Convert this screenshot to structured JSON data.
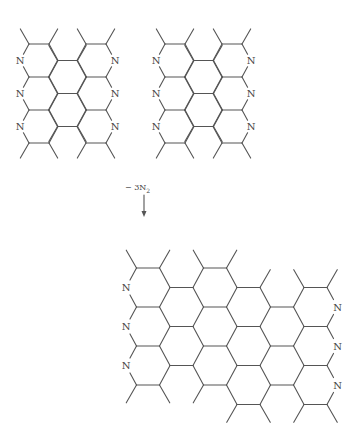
{
  "diagram": {
    "type": "chemical-reaction-scheme",
    "atom_label": "N",
    "line_color": "#555555",
    "text_color": "#444444",
    "reaction": {
      "minus_sign": "−",
      "coefficient": "3",
      "species": "N",
      "subscript": "2",
      "arrow": "down-arrow"
    },
    "reactants": [
      {
        "name": "reactant-left",
        "origin": [
          39,
          60.5
        ],
        "hex": {
          "rx": 19,
          "tx": 10,
          "ry": 16.5
        },
        "columns": [
          {
            "dx": 0,
            "dy": 0,
            "count": 3,
            "n_side": "left"
          },
          {
            "dx": 28.5,
            "dy": 16.5,
            "count": 2,
            "n_side": ""
          },
          {
            "dx": 57,
            "dy": 0,
            "count": 3,
            "n_side": "right"
          }
        ]
      },
      {
        "name": "reactant-right",
        "origin": [
          175,
          60.5
        ],
        "hex": {
          "rx": 19,
          "tx": 10,
          "ry": 16.5
        },
        "columns": [
          {
            "dx": 0,
            "dy": 0,
            "count": 3,
            "n_side": "left"
          },
          {
            "dx": 28.5,
            "dy": 16.5,
            "count": 2,
            "n_side": ""
          },
          {
            "dx": 57,
            "dy": 0,
            "count": 3,
            "n_side": "right"
          }
        ]
      }
    ],
    "product": {
      "name": "product",
      "origin": [
        148,
        287.5
      ],
      "hex": {
        "rx": 22,
        "tx": 11.5,
        "ry": 19.5
      },
      "columns": [
        {
          "dx": 0,
          "dy": 0,
          "count": 3,
          "n_side": "left"
        },
        {
          "dx": 33.5,
          "dy": 19.5,
          "count": 2,
          "n_side": ""
        },
        {
          "dx": 67,
          "dy": 0,
          "count": 3,
          "n_side": ""
        },
        {
          "dx": 100.5,
          "dy": 19.5,
          "count": 3,
          "n_side": ""
        },
        {
          "dx": 134,
          "dy": 39,
          "count": 2,
          "n_side": ""
        },
        {
          "dx": 167.5,
          "dy": 19.5,
          "count": 3,
          "n_side": "right"
        }
      ]
    }
  }
}
